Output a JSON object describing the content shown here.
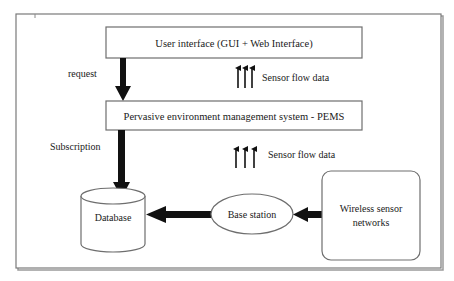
{
  "diagram": {
    "type": "architecture-flow",
    "nodes": {
      "user_interface": {
        "label": "User interface (GUI + Web Interface)",
        "shape": "rectangle"
      },
      "pems": {
        "label": "Pervasive environment management system - PEMS",
        "shape": "rectangle"
      },
      "database": {
        "label": "Database",
        "shape": "cylinder"
      },
      "base_station": {
        "label": "Base station",
        "shape": "ellipse"
      },
      "wsn": {
        "label_line1": "Wireless sensor",
        "label_line2": "networks",
        "shape": "rounded-rectangle"
      }
    },
    "edges": {
      "request": {
        "label": "request",
        "from": "User interface (GUI + Web Interface)",
        "to": "Pervasive environment management system - PEMS"
      },
      "subscription": {
        "label": "Subscription",
        "from": "Pervasive environment management system - PEMS",
        "to": "Database"
      },
      "sensor_flow_upper": {
        "label": "Sensor flow data",
        "from": "Pervasive environment management system - PEMS",
        "to": "User interface (GUI + Web Interface)"
      },
      "sensor_flow_lower": {
        "label": "Sensor flow data",
        "from": "Base station",
        "to": "Pervasive environment management system - PEMS"
      },
      "bs_to_db": {
        "from": "Base station",
        "to": "Database"
      },
      "wsn_to_bs": {
        "from": "Wireless sensor networks",
        "to": "Base station"
      }
    }
  },
  "colors": {
    "frame": "#7a7a7a",
    "box_border": "#6e6e6e",
    "arrow": "#111111",
    "text": "#1a1a1a"
  }
}
